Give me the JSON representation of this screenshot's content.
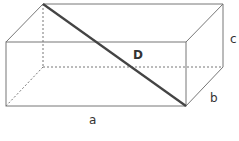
{
  "diagram": {
    "labels": {
      "length": "a",
      "width": "b",
      "height": "c",
      "diagonal": "D"
    }
  }
}
